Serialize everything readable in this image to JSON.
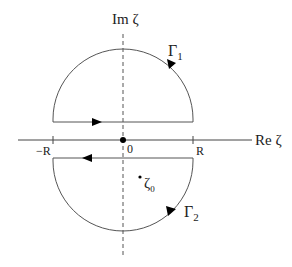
{
  "diagram": {
    "type": "contour-integration",
    "axes": {
      "imaginary_label": "Im ζ",
      "real_label": "Re ζ"
    },
    "ticks": {
      "neg_r": "−R",
      "origin": "0",
      "pos_r": "R"
    },
    "contours": [
      {
        "name": "Γ1",
        "label_main": "Γ",
        "label_sub": "1",
        "half": "upper",
        "direction": "counterclockwise"
      },
      {
        "name": "Γ2",
        "label_main": "Γ",
        "label_sub": "2",
        "half": "lower",
        "direction": "counterclockwise"
      }
    ],
    "point": {
      "label_main": "ζ",
      "label_sub": "0"
    },
    "colors": {
      "line": "#555555",
      "axis": "#444444",
      "arrow": "#000000"
    }
  }
}
